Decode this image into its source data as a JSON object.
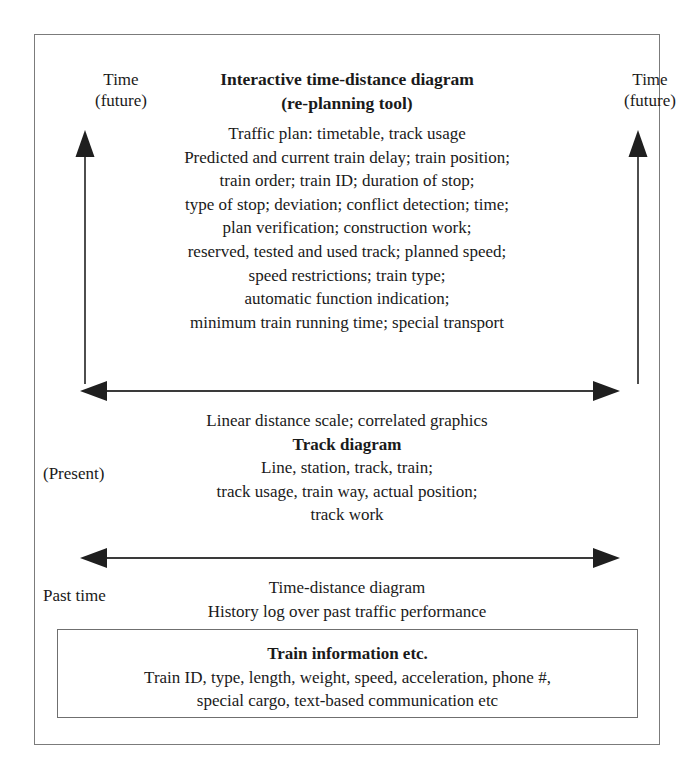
{
  "diagram": {
    "axis_labels": {
      "top_left": {
        "line1": "Time",
        "line2": "(future)"
      },
      "top_right": {
        "line1": "Time",
        "line2": "(future)"
      },
      "present": "(Present)",
      "past": "Past time"
    },
    "top_section": {
      "title_line1": "Interactive time-distance diagram",
      "title_line2": "(re-planning tool)",
      "items": [
        "Traffic plan: timetable, track usage",
        "Predicted and current train delay; train position;",
        "train order; train ID; duration of stop;",
        "type of stop; deviation; conflict detection; time;",
        "plan verification; construction work;",
        "reserved, tested and used track; planned speed;",
        "speed restrictions; train type;",
        "automatic function indication;",
        "minimum train running time; special transport"
      ]
    },
    "middle_section": {
      "caption": "Linear distance scale; correlated graphics",
      "title": "Track diagram",
      "items": [
        "Line, station, track, train;",
        "track usage, train way, actual position;",
        "track work"
      ]
    },
    "lower_section": {
      "items": [
        "Time-distance diagram",
        "History log over past traffic performance"
      ]
    },
    "info_box": {
      "title": "Train information etc.",
      "items": [
        "Train ID, type, length, weight, speed, acceleration, phone #,",
        "special cargo, text-based communication etc"
      ]
    },
    "colors": {
      "border": "#7b7b7b",
      "arrow": "#2b2b2b",
      "text": "#1a1a1a",
      "background": "#ffffff"
    }
  }
}
